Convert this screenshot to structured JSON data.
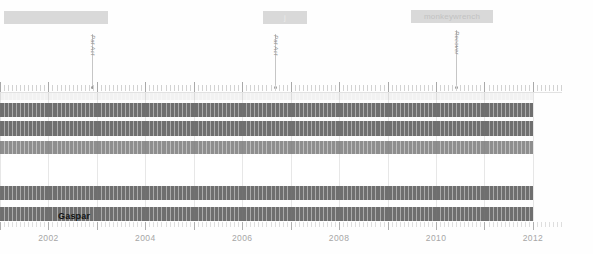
{
  "chart_data": {
    "type": "bar",
    "title": "",
    "xlabel": "",
    "ylabel": "",
    "orientation": "horizontal-timeline",
    "xlim": [
      2001.0,
      2012.6
    ],
    "grid": true,
    "legend_position": "none",
    "axis_years": [
      2002,
      2004,
      2006,
      2008,
      2010,
      2012
    ],
    "series": [
      {
        "name": "row-1",
        "start": 2001.0,
        "end": 2012.0,
        "color": "#f2f2f2",
        "height": 7,
        "top": 0
      },
      {
        "name": "row-2",
        "start": 2001.0,
        "end": 2012.0,
        "color": "#6f6f6f",
        "height": 14,
        "top": 10
      },
      {
        "name": "row-3",
        "start": 2001.0,
        "end": 2012.0,
        "color": "#6f6f6f",
        "height": 15,
        "top": 28
      },
      {
        "name": "row-4",
        "start": 2001.0,
        "end": 2012.0,
        "color": "#8e8e8e",
        "height": 13,
        "top": 48
      },
      {
        "name": "row-5",
        "start": 2001.0,
        "end": 2012.0,
        "color": "#ffffff",
        "height": 24,
        "top": 65
      },
      {
        "name": "row-6",
        "start": 2001.0,
        "end": 2012.0,
        "color": "#6f6f6f",
        "height": 14,
        "top": 93
      },
      {
        "name": "row-7",
        "start": 2001.0,
        "end": 2012.0,
        "color": "#6f6f6f",
        "height": 14,
        "top": 114
      }
    ],
    "row_label": "Gaspar",
    "row_label_x": 58,
    "row_label_y": 118
  },
  "annotations": {
    "chips": [
      {
        "label": "",
        "x": 4,
        "y": 11,
        "width": 104,
        "dark": false
      },
      {
        "label": "j",
        "x": 263,
        "y": 11,
        "width": 44,
        "dark": false
      },
      {
        "label": "monkeywrench",
        "x": 411,
        "y": 10,
        "width": 82,
        "dark": true
      }
    ],
    "markers": [
      {
        "label": "Pat Act",
        "x": 92,
        "stem_top": 34,
        "stem_height": 54
      },
      {
        "label": "Pat Act",
        "x": 275,
        "stem_top": 34,
        "stem_height": 54
      },
      {
        "label": "Recover",
        "x": 456,
        "stem_top": 30,
        "stem_height": 58
      }
    ]
  },
  "colors": {
    "bar_dark": "#6f6f6f",
    "bar_mid": "#8e8e8e",
    "bar_pale": "#f2f2f2",
    "chip": "#d9d9d9",
    "axis_text": "#a6a6a6",
    "page_bg": "#fefefe"
  }
}
